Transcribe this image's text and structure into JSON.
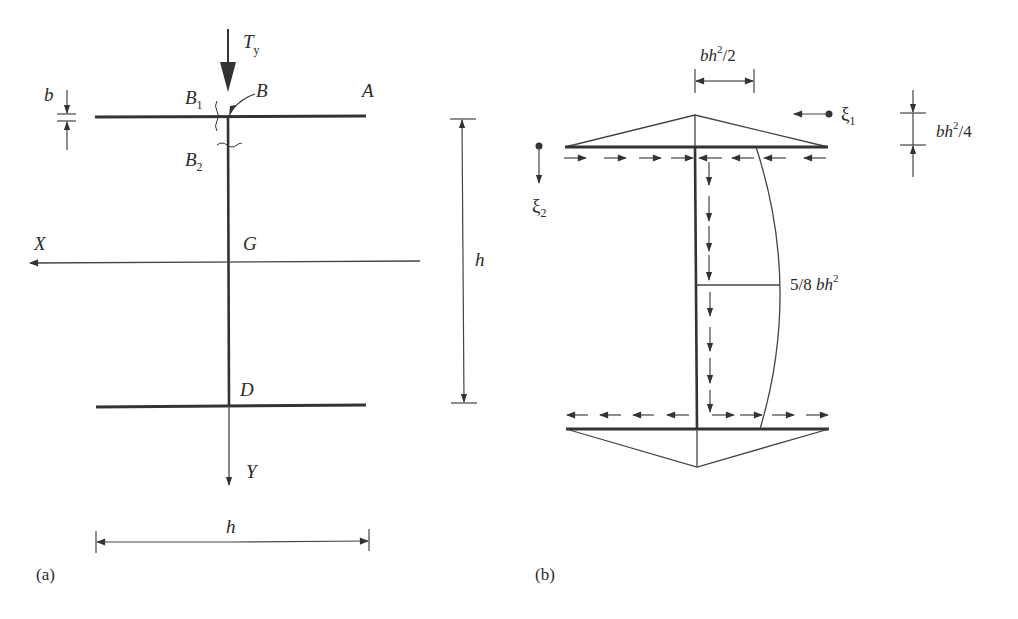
{
  "figure": {
    "type": "structural-diagram",
    "colors": {
      "ink": "#333333",
      "background": "#ffffff"
    }
  },
  "panel_a": {
    "tag": "(a)",
    "load": {
      "symbol": "T",
      "subscript": "y"
    },
    "points": {
      "A": "A",
      "B": "B",
      "B1": {
        "base": "B",
        "sub": "1"
      },
      "B2": {
        "base": "B",
        "sub": "2"
      },
      "G": "G",
      "D": "D"
    },
    "axes": {
      "x": "X",
      "y": "Y"
    },
    "dimensions": {
      "thickness": "b",
      "height": "h",
      "flange_width": "h"
    }
  },
  "panel_b": {
    "tag": "(b)",
    "labels": {
      "flange_peak": {
        "base": "bh",
        "sup": "2",
        "tail": "/2"
      },
      "flange_offset": {
        "base": "bh",
        "sup": "2",
        "tail": "/4"
      },
      "web_max": {
        "prefix": "5/8 ",
        "base": "bh",
        "sup": "2"
      }
    },
    "coordinates": {
      "xi1": {
        "base": "ξ",
        "sub": "1"
      },
      "xi2": {
        "base": "ξ",
        "sub": "2"
      }
    },
    "flow_arrows": {
      "top_flange_left": 4,
      "top_flange_right": 4,
      "web_upper": 4,
      "web_lower": 4,
      "bottom_flange_left": 4,
      "bottom_flange_right": 4
    }
  }
}
